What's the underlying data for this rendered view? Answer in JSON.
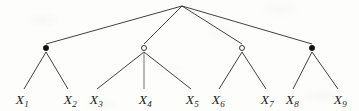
{
  "diagram": {
    "type": "tree",
    "width": 359,
    "height": 111,
    "background_color": "#fdfdfb",
    "edge_color": "#2b2b2b",
    "edge_color_light": "#8a8a8a",
    "node_fill_color": "#111111",
    "node_stroke_color": "#222222",
    "label_color": "#1b1b1b",
    "root": {
      "id": "root",
      "x": 182,
      "y": 6,
      "marker": "none",
      "label": ""
    },
    "internal_nodes": [
      {
        "id": "n1",
        "x": 46,
        "y": 48,
        "marker": "filled-dot",
        "marker_name": "filled-node-marker",
        "label": "",
        "children": [
          "x1",
          "x2"
        ]
      },
      {
        "id": "n2",
        "x": 144,
        "y": 48,
        "marker": "open-circle",
        "marker_name": "open-node-marker",
        "label": "",
        "children": [
          "x3",
          "x4",
          "x5"
        ]
      },
      {
        "id": "n3",
        "x": 242,
        "y": 48,
        "marker": "open-circle",
        "marker_name": "open-node-marker",
        "label": "",
        "children": [
          "x6",
          "x7"
        ]
      },
      {
        "id": "n4",
        "x": 312,
        "y": 48,
        "marker": "filled-dot",
        "marker_name": "filled-node-marker",
        "label": "",
        "children": [
          "x8",
          "x9"
        ]
      }
    ],
    "leaves": [
      {
        "id": "x1",
        "base": "X",
        "sub": "1",
        "text": "X1",
        "x": 22,
        "y": 100,
        "edge_x": 24,
        "parent": "n1",
        "edge_style": "solid"
      },
      {
        "id": "x2",
        "base": "X",
        "sub": "2",
        "text": "X2",
        "x": 70,
        "y": 100,
        "edge_x": 68,
        "parent": "n1",
        "edge_style": "solid"
      },
      {
        "id": "x3",
        "base": "X",
        "sub": "3",
        "text": "X3",
        "x": 96,
        "y": 100,
        "edge_x": 97,
        "parent": "n2",
        "edge_style": "solid"
      },
      {
        "id": "x4",
        "base": "X",
        "sub": "4",
        "text": "X4",
        "x": 145,
        "y": 100,
        "edge_x": 144,
        "parent": "n2",
        "edge_style": "light-vertical"
      },
      {
        "id": "x5",
        "base": "X",
        "sub": "5",
        "text": "X5",
        "x": 192,
        "y": 100,
        "edge_x": 191,
        "parent": "n2",
        "edge_style": "solid"
      },
      {
        "id": "x6",
        "base": "X",
        "sub": "6",
        "text": "X6",
        "x": 218,
        "y": 100,
        "edge_x": 219,
        "parent": "n3",
        "edge_style": "solid"
      },
      {
        "id": "x7",
        "base": "X",
        "sub": "7",
        "text": "X7",
        "x": 267,
        "y": 100,
        "edge_x": 266,
        "parent": "n3",
        "edge_style": "solid"
      },
      {
        "id": "x8",
        "base": "X",
        "sub": "8",
        "text": "X8",
        "x": 292,
        "y": 100,
        "edge_x": 293,
        "parent": "n4",
        "edge_style": "solid"
      },
      {
        "id": "x9",
        "base": "X",
        "sub": "9",
        "text": "X9",
        "x": 340,
        "y": 100,
        "edge_x": 338,
        "parent": "n4",
        "edge_style": "solid"
      }
    ]
  }
}
